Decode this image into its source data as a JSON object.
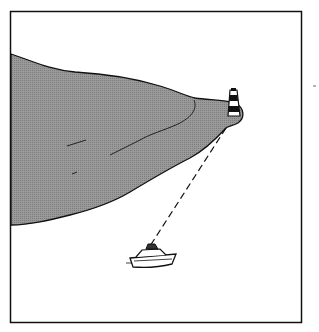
{
  "illustration": {
    "subject": "boat taking a bearing on a lighthouse at the tip of a headland",
    "elements": [
      "headland",
      "lighthouse",
      "bearing-line",
      "motor-boat"
    ],
    "colors": {
      "land_fill": "#8f8f8f",
      "outline": "#111111",
      "background": "#ffffff"
    }
  }
}
